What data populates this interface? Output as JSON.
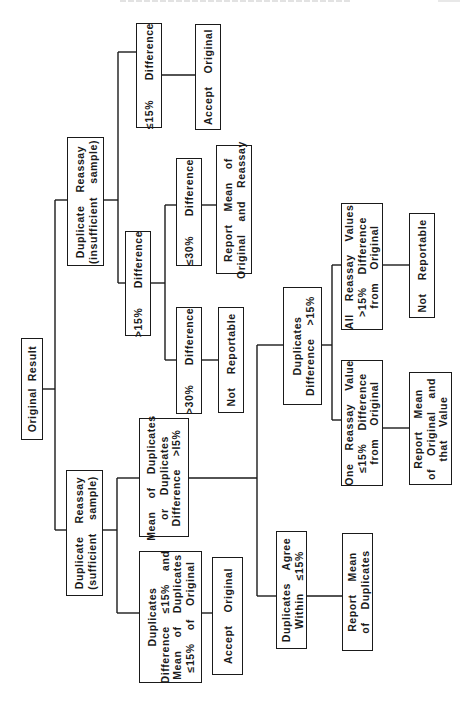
{
  "diagram": {
    "orientation": "rotated-90-ccw",
    "line_color": "#1a1a1a",
    "nodes": {
      "original_result": "Original Result",
      "dup_insufficient": "Duplicate  Reassay\n(insufficient  sample)",
      "ins_le15": "≤15%   Difference",
      "ins_accept": "Accept  Original",
      "ins_gt15": ">15%   Difference",
      "ins_le30": "≤30%   Difference",
      "ins_report_mean": "Report  Mean  of\nOriginal  and  Reassay",
      "ins_gt30": ">30%   Difference",
      "ins_not_reportable": "Not  Reportable",
      "dup_sufficient": "Duplicate  Reassay\n(sufficient  sample)",
      "suf_mean_or_diff": "Mean  of  Duplicates\nor  Duplicates\nDifference  >I5%",
      "suf_dup_le15": "Duplicates\nDifference  ≤15%  and\nMean  of  Duplicates\n≤15%  of  Original",
      "suf_accept": "Accept  Original",
      "suf_dup_gt15": "Duplicates\nDifference  >15%",
      "suf_agree": "Duplicates  Agree\nWithin  ≤15%",
      "suf_report_dup": "Report  Mean\nof  Duplicates",
      "suf_all_gt15": "All  Reassay  Values\n>15%  Difference\nfrom  Original",
      "suf_not_reportable": "Not  Reportable",
      "suf_one_le15": "One  Reassay  Value\n≤15%  Difference\nfrom  Original",
      "suf_report_that": "Report  Mean\nof  Original  and\nthat  Value"
    },
    "edges": [
      [
        "original_result",
        "dup_insufficient"
      ],
      [
        "original_result",
        "dup_sufficient"
      ],
      [
        "dup_insufficient",
        "ins_le15"
      ],
      [
        "ins_le15",
        "ins_accept"
      ],
      [
        "dup_insufficient",
        "ins_gt15"
      ],
      [
        "ins_gt15",
        "ins_le30"
      ],
      [
        "ins_le30",
        "ins_report_mean"
      ],
      [
        "ins_gt15",
        "ins_gt30"
      ],
      [
        "ins_gt30",
        "ins_not_reportable"
      ],
      [
        "dup_sufficient",
        "suf_mean_or_diff"
      ],
      [
        "dup_sufficient",
        "suf_dup_le15"
      ],
      [
        "suf_dup_le15",
        "suf_accept"
      ],
      [
        "suf_mean_or_diff",
        "suf_dup_gt15"
      ],
      [
        "suf_mean_or_diff",
        "suf_agree"
      ],
      [
        "suf_agree",
        "suf_report_dup"
      ],
      [
        "suf_dup_gt15",
        "suf_all_gt15"
      ],
      [
        "suf_all_gt15",
        "suf_not_reportable"
      ],
      [
        "suf_dup_gt15",
        "suf_one_le15"
      ],
      [
        "suf_one_le15",
        "suf_report_that"
      ]
    ]
  }
}
